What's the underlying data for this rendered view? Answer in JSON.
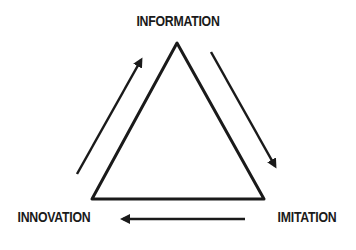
{
  "diagram": {
    "nodes": {
      "top": "INFORMATION",
      "bottom_right": "IMITATION",
      "bottom_left": "INNOVATION"
    },
    "edges": [
      {
        "from": "INFORMATION",
        "to": "IMITATION",
        "direction": "down-right"
      },
      {
        "from": "IMITATION",
        "to": "INNOVATION",
        "direction": "left"
      },
      {
        "from": "INNOVATION",
        "to": "INFORMATION",
        "direction": "up-right"
      }
    ],
    "colors": {
      "stroke": "#1a1a1a",
      "background": "#ffffff"
    }
  }
}
